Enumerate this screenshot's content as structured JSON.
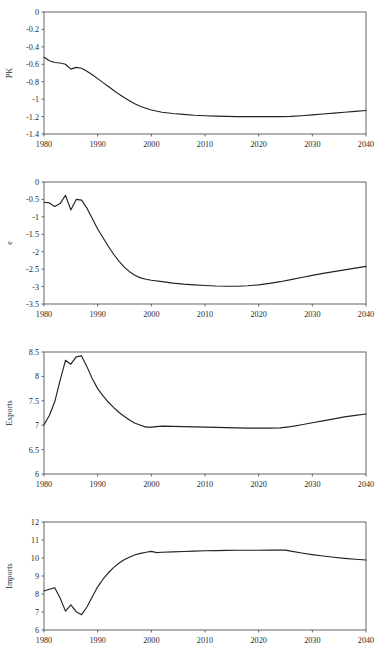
{
  "figure": {
    "panel_count": 4,
    "line_color": "#222222",
    "axis_color": "#555555",
    "background": "#ffffff",
    "caption": ""
  },
  "chart_data": [
    {
      "type": "line",
      "name": "PK",
      "title": "",
      "xlabel": "",
      "ylabel": "PK",
      "xlim": [
        1980,
        2040
      ],
      "ylim": [
        -1.4,
        0
      ],
      "grid": false,
      "legend": "none",
      "xticks": [
        1980,
        1990,
        2000,
        2010,
        2020,
        2030,
        2040
      ],
      "xticklabels": [
        "1980",
        "1990",
        "2000",
        "2010",
        "2020",
        "2030",
        "2040"
      ],
      "yticks": [
        0,
        -0.2,
        -0.4,
        -0.6,
        -0.8,
        -1,
        -1.2,
        -1.4
      ],
      "yticklabels": [
        "0",
        "-0.2",
        "-0.4",
        "-0.6",
        "-0.8",
        "-1",
        "-1.2",
        "-1.4"
      ],
      "x": [
        1980,
        1981,
        1982,
        1983,
        1984,
        1985,
        1986,
        1987,
        1988,
        1989,
        1990,
        1991,
        1992,
        1993,
        1994,
        1995,
        1996,
        1997,
        1998,
        1999,
        2000,
        2002,
        2004,
        2006,
        2008,
        2010,
        2012,
        2014,
        2016,
        2018,
        2020,
        2022,
        2024,
        2026,
        2028,
        2030,
        2032,
        2034,
        2036,
        2038,
        2040
      ],
      "y": [
        -0.52,
        -0.56,
        -0.58,
        -0.585,
        -0.6,
        -0.655,
        -0.635,
        -0.645,
        -0.68,
        -0.72,
        -0.765,
        -0.81,
        -0.855,
        -0.9,
        -0.945,
        -0.985,
        -1.02,
        -1.055,
        -1.085,
        -1.105,
        -1.125,
        -1.15,
        -1.165,
        -1.175,
        -1.185,
        -1.19,
        -1.195,
        -1.198,
        -1.2,
        -1.2,
        -1.2,
        -1.2,
        -1.2,
        -1.198,
        -1.19,
        -1.18,
        -1.17,
        -1.16,
        -1.15,
        -1.14,
        -1.13
      ]
    },
    {
      "type": "line",
      "name": "e",
      "title": "",
      "xlabel": "",
      "ylabel": "e",
      "xlim": [
        1980,
        2040
      ],
      "ylim": [
        -3.5,
        0
      ],
      "grid": false,
      "legend": "none",
      "xticks": [
        1980,
        1990,
        2000,
        2010,
        2020,
        2030,
        2040
      ],
      "xticklabels": [
        "1980",
        "1990",
        "2000",
        "2010",
        "2020",
        "2030",
        "2040"
      ],
      "yticks": [
        0,
        -0.5,
        -1,
        -1.5,
        -2,
        -2.5,
        -3,
        -3.5
      ],
      "yticklabels": [
        "0",
        "-0.5",
        "-1",
        "-1.5",
        "-2",
        "-2.5",
        "-3",
        "-3.5"
      ],
      "x": [
        1980,
        1981,
        1982,
        1983,
        1984,
        1985,
        1986,
        1987,
        1988,
        1989,
        1990,
        1991,
        1992,
        1993,
        1994,
        1995,
        1996,
        1997,
        1998,
        1999,
        2000,
        2002,
        2004,
        2006,
        2008,
        2010,
        2012,
        2014,
        2016,
        2018,
        2020,
        2022,
        2024,
        2026,
        2028,
        2030,
        2032,
        2034,
        2036,
        2038,
        2040
      ],
      "y": [
        -0.58,
        -0.6,
        -0.7,
        -0.62,
        -0.38,
        -0.8,
        -0.5,
        -0.52,
        -0.75,
        -1.05,
        -1.35,
        -1.6,
        -1.85,
        -2.08,
        -2.28,
        -2.45,
        -2.58,
        -2.68,
        -2.75,
        -2.79,
        -2.82,
        -2.86,
        -2.9,
        -2.93,
        -2.95,
        -2.97,
        -2.985,
        -2.99,
        -2.99,
        -2.975,
        -2.95,
        -2.91,
        -2.86,
        -2.8,
        -2.74,
        -2.68,
        -2.62,
        -2.57,
        -2.52,
        -2.47,
        -2.42
      ]
    },
    {
      "type": "line",
      "name": "Exports",
      "title": "",
      "xlabel": "",
      "ylabel": "Exports",
      "xlim": [
        1980,
        2040
      ],
      "ylim": [
        6,
        8.5
      ],
      "grid": false,
      "legend": "none",
      "xticks": [
        1980,
        1990,
        2000,
        2010,
        2020,
        2030,
        2040
      ],
      "xticklabels": [
        "1980",
        "1990",
        "2000",
        "2010",
        "2020",
        "2030",
        "2040"
      ],
      "yticks": [
        8.5,
        8,
        7.5,
        7,
        6.5,
        6
      ],
      "yticklabels": [
        "8.5",
        "8",
        "7.5",
        "7",
        "6.5",
        "6"
      ],
      "x": [
        1980,
        1981,
        1982,
        1983,
        1984,
        1985,
        1986,
        1987,
        1988,
        1989,
        1990,
        1991,
        1992,
        1993,
        1994,
        1995,
        1996,
        1997,
        1998,
        1999,
        2000,
        2002,
        2004,
        2006,
        2008,
        2010,
        2012,
        2014,
        2016,
        2018,
        2020,
        2022,
        2024,
        2026,
        2028,
        2030,
        2032,
        2034,
        2036,
        2038,
        2040
      ],
      "y": [
        7.01,
        7.2,
        7.48,
        7.92,
        8.33,
        8.25,
        8.4,
        8.42,
        8.2,
        7.95,
        7.75,
        7.6,
        7.47,
        7.36,
        7.26,
        7.18,
        7.1,
        7.04,
        7.0,
        6.96,
        6.96,
        6.98,
        6.975,
        6.97,
        6.965,
        6.96,
        6.955,
        6.95,
        6.945,
        6.94,
        6.94,
        6.94,
        6.945,
        6.97,
        7.01,
        7.05,
        7.09,
        7.13,
        7.17,
        7.2,
        7.23
      ]
    },
    {
      "type": "line",
      "name": "Imports",
      "title": "",
      "xlabel": "",
      "ylabel": "Imports",
      "xlim": [
        1980,
        2040
      ],
      "ylim": [
        6,
        12
      ],
      "grid": false,
      "legend": "none",
      "xticks": [
        1980,
        1990,
        2000,
        2010,
        2020,
        2030,
        2040
      ],
      "xticklabels": [
        "1980",
        "1990",
        "2000",
        "2010",
        "2020",
        "2030",
        "2040"
      ],
      "yticks": [
        12,
        11,
        10,
        9,
        8,
        7,
        6
      ],
      "yticklabels": [
        "12",
        "11",
        "10",
        "9",
        "8",
        "7",
        "6"
      ],
      "x": [
        1980,
        1981,
        1982,
        1983,
        1984,
        1985,
        1986,
        1987,
        1988,
        1989,
        1990,
        1991,
        1992,
        1993,
        1994,
        1995,
        1996,
        1997,
        1998,
        1999,
        2000,
        2001,
        2002,
        2004,
        2006,
        2008,
        2010,
        2012,
        2014,
        2016,
        2018,
        2020,
        2022,
        2024,
        2025,
        2026,
        2028,
        2030,
        2032,
        2034,
        2036,
        2038,
        2040
      ],
      "y": [
        8.17,
        8.26,
        8.35,
        7.78,
        7.05,
        7.4,
        7.02,
        6.85,
        7.28,
        7.85,
        8.4,
        8.82,
        9.18,
        9.48,
        9.72,
        9.92,
        10.06,
        10.18,
        10.26,
        10.32,
        10.37,
        10.3,
        10.32,
        10.34,
        10.36,
        10.38,
        10.4,
        10.41,
        10.42,
        10.43,
        10.43,
        10.43,
        10.44,
        10.44,
        10.44,
        10.38,
        10.28,
        10.19,
        10.11,
        10.04,
        9.98,
        9.93,
        9.89
      ]
    }
  ]
}
